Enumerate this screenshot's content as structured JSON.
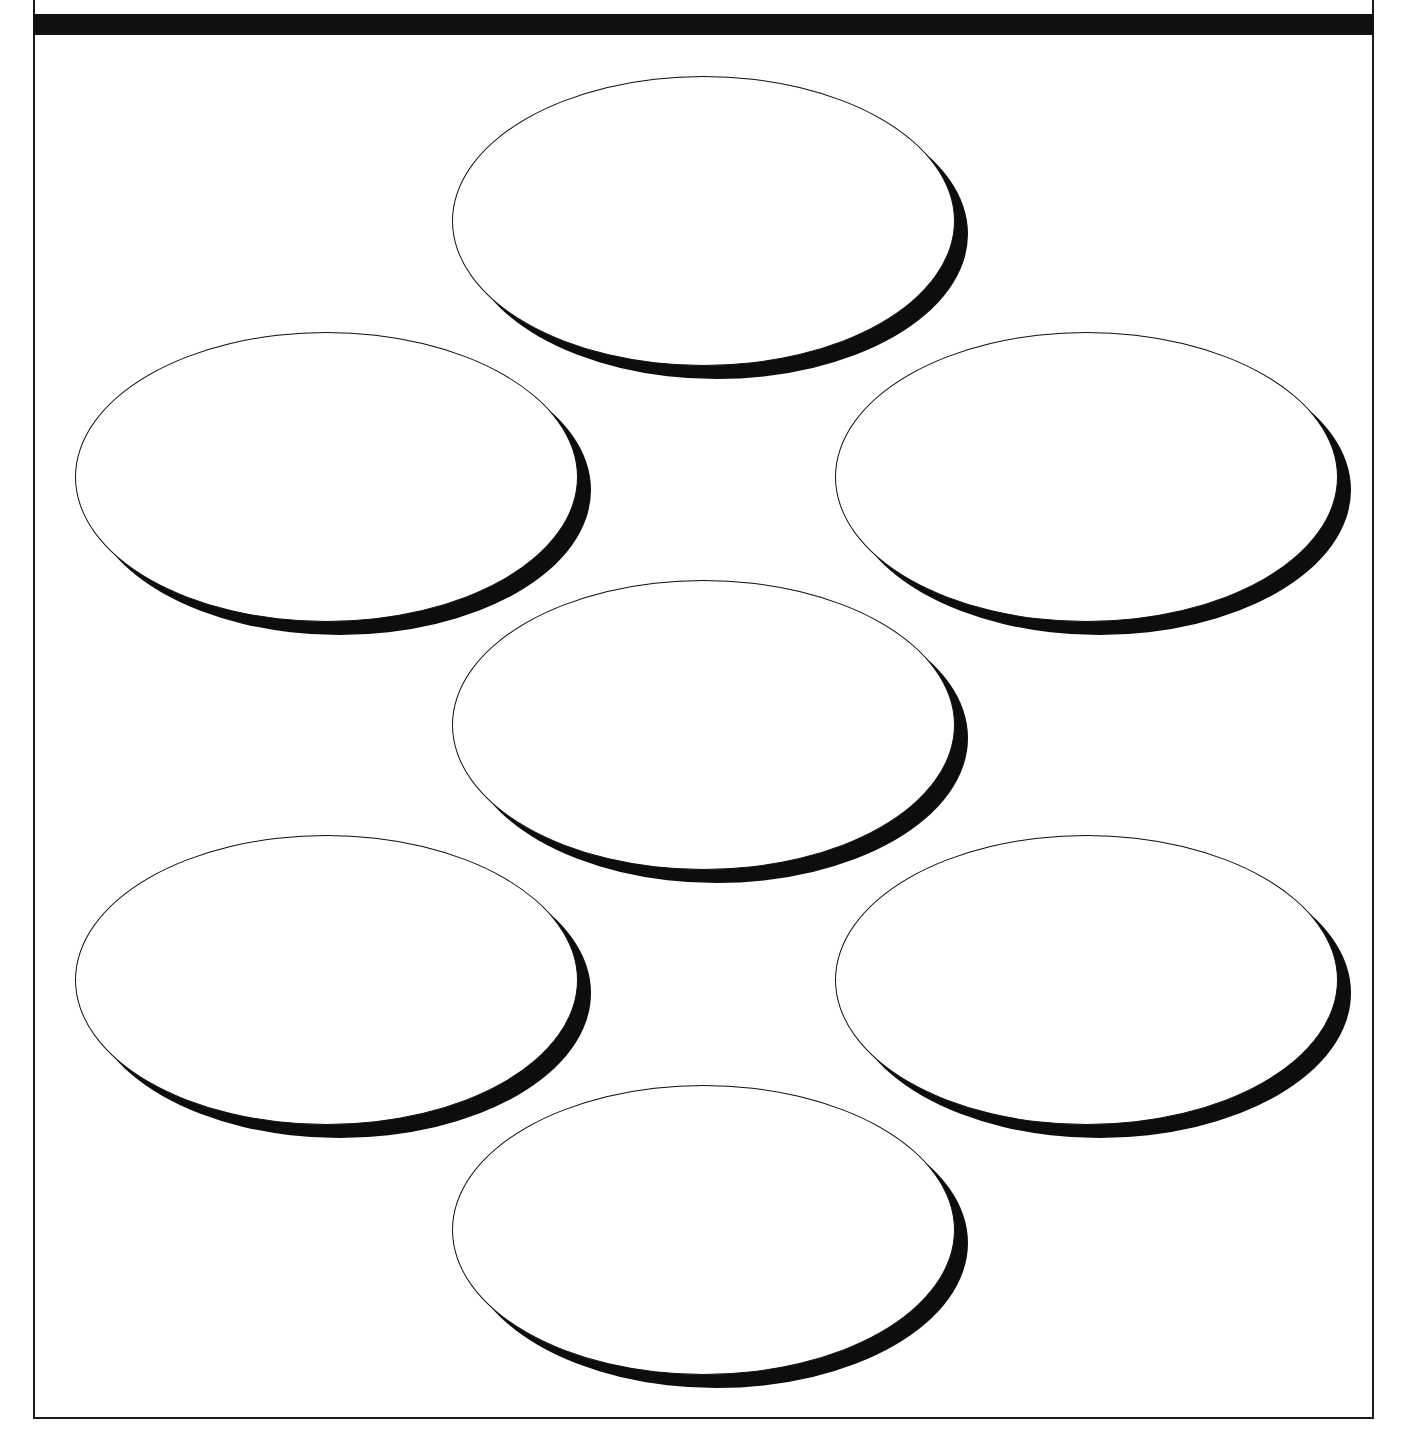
{
  "document": {
    "kind": "blank-ellipse-worksheet",
    "page_width": 1411,
    "page_height": 1441,
    "background_color": "#ffffff",
    "ink_color": "#111111"
  },
  "page_frame": {
    "name": "page-border",
    "left": 33,
    "top": 0,
    "width": 1341,
    "height": 1419,
    "stroke_color": "#1a1a1a",
    "stroke_width": 2
  },
  "header_rule": {
    "name": "thick-top-rule",
    "left": 33,
    "top": 14,
    "width": 1341,
    "height": 21,
    "color": "#111111"
  },
  "ellipses": {
    "count": 7,
    "arrangement": "flower / honeycomb — 3 in center column, 2 in left column, 2 in right column",
    "width": 503,
    "height": 290,
    "shadow_offset_x": 13,
    "shadow_offset_y": 13,
    "fill_color": "#ffffff",
    "outline_color": "#111111",
    "shadow_color": "#0d0d0d",
    "items": [
      {
        "id": "ellipse-top-center",
        "position": "top-center",
        "left": 452,
        "top": 76,
        "label": ""
      },
      {
        "id": "ellipse-middle-left",
        "position": "middle-left",
        "left": 75,
        "top": 332,
        "label": ""
      },
      {
        "id": "ellipse-middle-right",
        "position": "middle-right",
        "left": 835,
        "top": 332,
        "label": ""
      },
      {
        "id": "ellipse-center",
        "position": "center",
        "left": 452,
        "top": 580,
        "label": ""
      },
      {
        "id": "ellipse-lower-left",
        "position": "lower-left",
        "left": 75,
        "top": 835,
        "label": ""
      },
      {
        "id": "ellipse-lower-right",
        "position": "lower-right",
        "left": 835,
        "top": 835,
        "label": ""
      },
      {
        "id": "ellipse-bottom-center",
        "position": "bottom-center",
        "left": 452,
        "top": 1085,
        "label": ""
      }
    ]
  }
}
